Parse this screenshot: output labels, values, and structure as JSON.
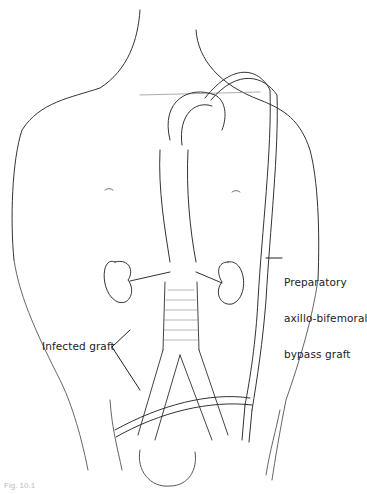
{
  "diagram": {
    "labels": {
      "bypass_line1": "Preparatory",
      "bypass_line2": "axillo-bifemoral",
      "bypass_line3": "bypass graft",
      "infected": "Infected graft"
    },
    "caption": "Fig. 10.1"
  }
}
